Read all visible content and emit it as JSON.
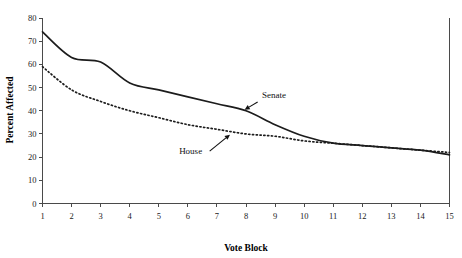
{
  "chart_data": {
    "type": "line",
    "title": "",
    "xlabel": "Vote Block",
    "ylabel": "Percent Affected",
    "xlim": [
      1,
      15
    ],
    "ylim": [
      0,
      80
    ],
    "grid": false,
    "legend_position": "inline-annotations",
    "x": [
      1,
      2,
      3,
      4,
      5,
      6,
      7,
      8,
      9,
      10,
      11,
      12,
      13,
      14,
      15
    ],
    "xticks": [
      "1",
      "2",
      "3",
      "4",
      "5",
      "6",
      "7",
      "8",
      "9",
      "10",
      "11",
      "12",
      "13",
      "14",
      "15"
    ],
    "yticks": [
      "0",
      "10",
      "20",
      "30",
      "40",
      "50",
      "60",
      "70",
      "80"
    ],
    "series": [
      {
        "name": "Senate",
        "style": "solid",
        "values": [
          74,
          63,
          61,
          52,
          49,
          46,
          43,
          40,
          34,
          29,
          26,
          25,
          24,
          23,
          21
        ]
      },
      {
        "name": "House",
        "style": "dotted",
        "values": [
          59,
          49,
          44,
          40,
          37,
          34,
          32,
          30,
          29,
          27,
          26,
          25,
          24,
          23,
          22
        ]
      }
    ],
    "annotations": [
      {
        "text": "Senate",
        "label_x": 8.55,
        "label_y": 45.5,
        "arrow_from_x": 8.4,
        "arrow_from_y": 43.8,
        "arrow_to_x": 7.95,
        "arrow_to_y": 40.4
      },
      {
        "text": "House",
        "label_x": 5.7,
        "label_y": 21.5,
        "arrow_from_x": 6.75,
        "arrow_from_y": 22.6,
        "arrow_to_x": 7.45,
        "arrow_to_y": 29.7
      }
    ]
  }
}
